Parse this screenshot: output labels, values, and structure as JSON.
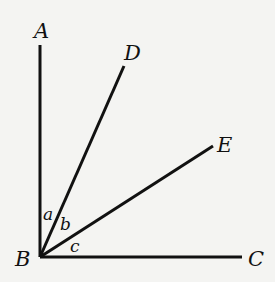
{
  "diagram": {
    "vertex": {
      "label": "B",
      "x": 40,
      "y": 257
    },
    "rays": [
      {
        "label": "A",
        "x2": 40,
        "y2": 45,
        "lx": 34,
        "ly": 38
      },
      {
        "label": "D",
        "x2": 124,
        "y2": 66,
        "lx": 124,
        "ly": 60
      },
      {
        "label": "E",
        "x2": 213,
        "y2": 146,
        "lx": 217,
        "ly": 152
      },
      {
        "label": "C",
        "x2": 242,
        "y2": 257,
        "lx": 248,
        "ly": 266
      }
    ],
    "angles": [
      {
        "label": "a",
        "x": 43,
        "y": 220
      },
      {
        "label": "b",
        "x": 60,
        "y": 230
      },
      {
        "label": "c",
        "x": 70,
        "y": 252
      }
    ]
  }
}
